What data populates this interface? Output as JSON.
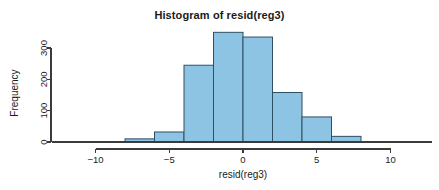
{
  "chart_data": {
    "type": "bar",
    "title": "Histogram of resid(reg3)",
    "xlabel": "resid(reg3)",
    "ylabel": "Frequency",
    "bin_width": 2,
    "bin_starts": [
      -8,
      -6,
      -4,
      -2,
      0,
      2,
      4,
      6
    ],
    "bin_ends": [
      -6,
      -4,
      -2,
      0,
      2,
      4,
      6,
      8
    ],
    "categories": [
      "-8 to -6",
      "-6 to -4",
      "-4 to -2",
      "-2 to 0",
      "0 to 2",
      "2 to 4",
      "4 to 6",
      "6 to 8"
    ],
    "values": [
      10,
      32,
      245,
      350,
      335,
      158,
      80,
      18
    ],
    "xlim": [
      -11,
      11
    ],
    "ylim": [
      0,
      380
    ],
    "xticks": [
      -10,
      -5,
      0,
      5,
      10
    ],
    "xtick_labels": [
      "−10",
      "−5",
      "0",
      "5",
      "10"
    ],
    "yticks": [
      0,
      100,
      200,
      300
    ],
    "ytick_labels": [
      "0",
      "100",
      "200",
      "300"
    ],
    "grid": false,
    "legend": false,
    "bar_fill_color": "#8ec4e3",
    "bar_border_color": "#2f4f63",
    "axis_color": "#3b3b3b",
    "background_color": "#ffffff"
  }
}
